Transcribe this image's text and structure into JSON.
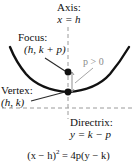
{
  "figure": {
    "orientation": "opens-upward",
    "equation": {
      "lhs_base": "(x − h)",
      "lhs_exponent": "2",
      "relation": "=",
      "rhs": "4p(y − k)",
      "full": "(x − h)² = 4p(y − k)"
    },
    "labels": {
      "axis": {
        "name": "Axis:",
        "value": "x = h"
      },
      "focus": {
        "name": "Focus:",
        "value": "(h, k + p)"
      },
      "vertex": {
        "name": "Vertex:",
        "value": "(h, k)"
      },
      "directrix": {
        "name": "Directrix:",
        "value": "y = k − p"
      },
      "parameter": {
        "value": "p > 0"
      }
    },
    "points": {
      "focus": {
        "x": 68,
        "y": 72,
        "label": "focus-point"
      },
      "vertex": {
        "x": 68,
        "y": 92,
        "label": "vertex-point"
      }
    },
    "lines": {
      "axis_of_symmetry": {
        "x": 68,
        "y1": 27,
        "y2": 119,
        "style": "dashed"
      },
      "directrix": {
        "y": 108,
        "x1": 2,
        "x2": 135,
        "style": "dashed"
      }
    },
    "colors": {
      "curve": "#111111",
      "dashed": "#9a9a9a",
      "parameter_text": "#8a8a8a",
      "leader": "#555555",
      "background": "#ffffff",
      "text": "#111111"
    }
  }
}
